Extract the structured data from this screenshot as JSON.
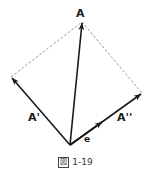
{
  "figure": {
    "caption_prefix": "図",
    "caption_number": "1-19",
    "labels": {
      "A": "A",
      "A_prime": "A'",
      "A_double_prime": "A''",
      "e": "e"
    },
    "points": {
      "origin": [
        70,
        145
      ],
      "A": [
        82,
        22
      ],
      "A_prime": [
        11,
        77
      ],
      "A_double_prime": [
        142,
        93
      ],
      "e_tip": [
        102,
        122
      ]
    },
    "colors": {
      "vector": "#1a1a1a",
      "dashed": "#777777"
    }
  }
}
